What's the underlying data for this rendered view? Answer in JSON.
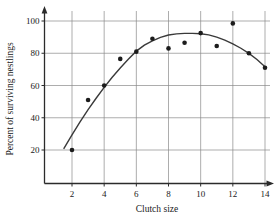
{
  "chart_data": {
    "type": "scatter",
    "title": "",
    "subtitle": "",
    "xlabel": "Clutch size",
    "ylabel": "Percent of surviving nestlings",
    "xlim": [
      0,
      15
    ],
    "ylim": [
      0,
      107
    ],
    "grid": true,
    "legend": null,
    "x_ticks": [
      2,
      4,
      6,
      8,
      10,
      12,
      14
    ],
    "x_tick_labels": [
      "2",
      "4",
      "6",
      "8",
      "10",
      "12",
      "14"
    ],
    "y_ticks": [
      20,
      40,
      60,
      80,
      100
    ],
    "y_tick_labels": [
      "20",
      "40",
      "60",
      "80",
      "100"
    ],
    "x": [
      2,
      3,
      4,
      5,
      6,
      7,
      8,
      9,
      10,
      11,
      12,
      13,
      14
    ],
    "values": [
      20,
      51,
      60,
      76.5,
      81,
      89,
      83,
      86.5,
      92.5,
      84.5,
      98.5,
      80,
      71
    ],
    "points": [
      {
        "x": 2,
        "y": 20
      },
      {
        "x": 3,
        "y": 51
      },
      {
        "x": 4,
        "y": 60
      },
      {
        "x": 5,
        "y": 76.5
      },
      {
        "x": 6,
        "y": 81
      },
      {
        "x": 7,
        "y": 89
      },
      {
        "x": 8,
        "y": 83
      },
      {
        "x": 9,
        "y": 86.5
      },
      {
        "x": 10,
        "y": 92.5
      },
      {
        "x": 11,
        "y": 84.5
      },
      {
        "x": 12,
        "y": 98.5
      },
      {
        "x": 13,
        "y": 80
      },
      {
        "x": 14,
        "y": 71
      }
    ],
    "fit_curve": {
      "type": "quadratic",
      "x_start": 1.5,
      "x_end": 14.0,
      "vertex_x": 9.5,
      "vertex_y": 92.3,
      "curvature": -0.88,
      "samples": [
        {
          "x": 1.5,
          "y": 21.0
        },
        {
          "x": 2.0,
          "y": 29.4
        },
        {
          "x": 2.5,
          "y": 37.4
        },
        {
          "x": 3.0,
          "y": 45.0
        },
        {
          "x": 3.5,
          "y": 52.1
        },
        {
          "x": 4.0,
          "y": 58.8
        },
        {
          "x": 4.5,
          "y": 65.1
        },
        {
          "x": 5.0,
          "y": 70.9
        },
        {
          "x": 5.5,
          "y": 76.3
        },
        {
          "x": 6.0,
          "y": 81.3
        },
        {
          "x": 6.5,
          "y": 85.0
        },
        {
          "x": 7.0,
          "y": 87.7
        },
        {
          "x": 7.5,
          "y": 89.8
        },
        {
          "x": 8.0,
          "y": 91.3
        },
        {
          "x": 8.5,
          "y": 92.0
        },
        {
          "x": 9.0,
          "y": 92.3
        },
        {
          "x": 9.5,
          "y": 92.3
        },
        {
          "x": 10.0,
          "y": 92.1
        },
        {
          "x": 10.5,
          "y": 91.4
        },
        {
          "x": 11.0,
          "y": 90.0
        },
        {
          "x": 11.5,
          "y": 88.2
        },
        {
          "x": 12.0,
          "y": 85.8
        },
        {
          "x": 12.5,
          "y": 83.1
        },
        {
          "x": 13.0,
          "y": 79.9
        },
        {
          "x": 13.5,
          "y": 76.1
        },
        {
          "x": 14.0,
          "y": 71.6
        }
      ]
    },
    "colors": {
      "point": "#1c1c1c",
      "curve": "#3a3a3a",
      "grid": "#8a8a8a",
      "axis": "#2b2b2b",
      "background": "#ffffff"
    }
  }
}
